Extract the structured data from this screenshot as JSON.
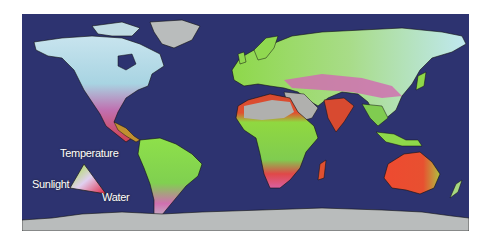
{
  "map": {
    "title": "",
    "background_ocean": "#2d3370",
    "legend": {
      "type": "ternary-triangle",
      "labels": {
        "top": "Temperature",
        "left": "Sunlight",
        "right": "Water"
      },
      "colors": {
        "sunlight": "#9be030",
        "temperature": "#e8f0ff",
        "water": "#e0243a"
      }
    },
    "land_colors": {
      "ice": "#b9bcbc",
      "desert": "#b0b0ae",
      "cold_limited": "#a8d8e8",
      "water_limited": "#e8404a",
      "light_limited": "#8ee03c",
      "mixed": "#d070b0"
    }
  }
}
